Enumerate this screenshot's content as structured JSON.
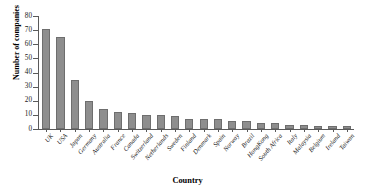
{
  "chart_data": {
    "type": "bar",
    "title": "",
    "xlabel": "Country",
    "ylabel": "Number of companies",
    "categories": [
      "UK",
      "USA",
      "Japan",
      "Germany",
      "Australia",
      "France",
      "Canada",
      "Switzerland",
      "Netherlands",
      "Sweden",
      "Finland",
      "Denmark",
      "Spain",
      "Norway",
      "Brazil",
      "HongKong",
      "South Africa",
      "Italy",
      "Malaysia",
      "Belgium",
      "Ireland",
      "Taiwan"
    ],
    "values": [
      71,
      65,
      35,
      20,
      14,
      12,
      11,
      10,
      10,
      9,
      7,
      7,
      7,
      6,
      6,
      4,
      4,
      3,
      3,
      2,
      2,
      2
    ],
    "ylim": [
      0,
      80
    ],
    "yticks": [
      0,
      10,
      20,
      30,
      40,
      50,
      60,
      70,
      80
    ],
    "ytick_labels": [
      "0",
      "10",
      "20",
      "30",
      "40",
      "50",
      "60",
      "70",
      "80"
    ],
    "grid": false,
    "legend": "none",
    "bar_color": "#8e8e8e",
    "axis_color": "#5a5a5a"
  }
}
